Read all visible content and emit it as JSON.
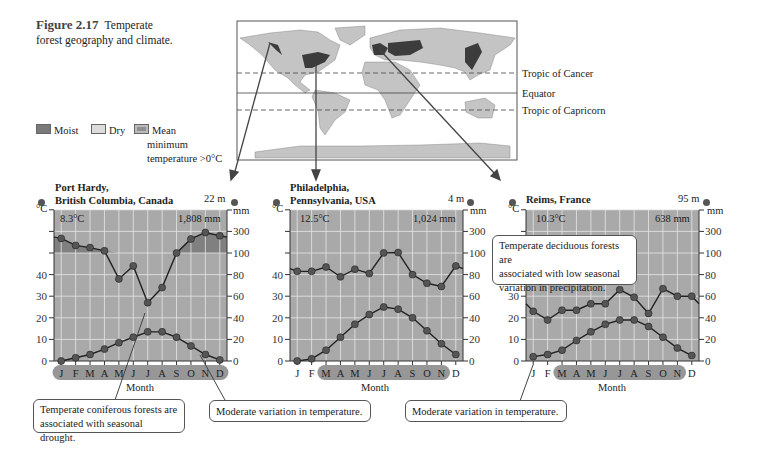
{
  "figure": {
    "number": "Figure 2.17",
    "caption_line1": "Temperate",
    "caption_line2": "forest geography and climate."
  },
  "legend": {
    "moist": "Moist",
    "dry": "Dry",
    "mean_line1": "Mean",
    "mean_line2": "minimum",
    "mean_line3": "temperature >0°C",
    "colors": {
      "moist": "#7a7a7a",
      "dry": "#d8d8d8",
      "mean_min": "#909090"
    }
  },
  "map": {
    "tropic_cancer": "Tropic of Cancer",
    "equator": "Equator",
    "tropic_capricorn": "Tropic of Capricorn"
  },
  "colors": {
    "plot_bg": "#a9a9a9",
    "moist_band": "#808080",
    "grid": "#e6e6e6",
    "line": "#222222",
    "dot": "#555555",
    "land": "#c4c4c4",
    "forest": "#3c3c3c",
    "month_band": "#7d7d7d"
  },
  "callouts": {
    "coniferous_line1": "Temperate coniferous forests are",
    "coniferous_line2": "associated with seasonal drought.",
    "moderate1": "Moderate variation in temperature.",
    "moderate2": "Moderate variation in temperature.",
    "deciduous_line1": "Temperate deciduous forests are",
    "deciduous_line2": "associated with low seasonal",
    "deciduous_line3": "variation in precipitation."
  },
  "axes": {
    "left_unit": "°C",
    "right_unit": "mm",
    "left_ticks": [
      "40",
      "30",
      "20",
      "10",
      "0"
    ],
    "right_ticks": [
      "300",
      "100",
      "80",
      "60",
      "40",
      "20",
      "0"
    ],
    "xlabel": "Month",
    "months": [
      "J",
      "F",
      "M",
      "A",
      "M",
      "J",
      "J",
      "A",
      "S",
      "O",
      "N",
      "D"
    ]
  },
  "chart_data": [
    {
      "type": "line",
      "title": "Port Hardy, British Columbia, Canada",
      "station_line1": "Port Hardy,",
      "station_line2": "British Columbia, Canada",
      "altitude": "22 m",
      "mean_temp": "8.3°C",
      "annual_precip": "1,808 mm",
      "xlabel": "Month",
      "ylabel_left": "°C",
      "ylabel_right": "mm",
      "categories": [
        "J",
        "F",
        "M",
        "A",
        "M",
        "J",
        "J",
        "A",
        "S",
        "O",
        "N",
        "D"
      ],
      "series": [
        {
          "name": "Precipitation (mm)",
          "values": [
            235,
            170,
            150,
            120,
            76,
            88,
            54,
            68,
            100,
            230,
            290,
            260
          ]
        },
        {
          "name": "Temperature (°C)",
          "values": [
            0,
            1.5,
            3,
            5.5,
            8.5,
            11,
            13.5,
            13.5,
            11,
            7,
            3,
            0.5
          ]
        }
      ],
      "months_above_zero_min": [
        0,
        11
      ],
      "ylim_left": [
        0,
        50
      ],
      "ylim_right": [
        0,
        400
      ]
    },
    {
      "type": "line",
      "title": "Philadelphia, Pennsylvania, USA",
      "station_line1": "Philadelphia,",
      "station_line2": "Pennsylvania, USA",
      "altitude": "4 m",
      "mean_temp": "12.5°C",
      "annual_precip": "1,024 mm",
      "xlabel": "Month",
      "ylabel_left": "°C",
      "ylabel_right": "mm",
      "categories": [
        "J",
        "F",
        "M",
        "A",
        "M",
        "J",
        "J",
        "A",
        "S",
        "O",
        "N",
        "D"
      ],
      "series": [
        {
          "name": "Precipitation (mm)",
          "values": [
            83,
            83,
            87,
            78,
            85,
            81,
            101,
            104,
            80,
            72,
            69,
            88
          ]
        },
        {
          "name": "Temperature (°C)",
          "values": [
            0,
            1,
            5,
            11,
            17,
            21.5,
            25,
            24,
            20,
            14,
            8,
            3
          ]
        }
      ],
      "months_above_zero_min": [
        2,
        10
      ],
      "ylim_left": [
        0,
        50
      ],
      "ylim_right": [
        0,
        400
      ]
    },
    {
      "type": "line",
      "title": "Reims, France",
      "station_line1": "Reims, France",
      "station_line2": "",
      "altitude": "95 m",
      "mean_temp": "10.3°C",
      "annual_precip": "638 mm",
      "xlabel": "Month",
      "ylabel_left": "°C",
      "ylabel_right": "mm",
      "categories": [
        "J",
        "F",
        "M",
        "A",
        "M",
        "J",
        "J",
        "A",
        "S",
        "O",
        "N",
        "D"
      ],
      "series": [
        {
          "name": "Precipitation (mm)",
          "values": [
            46,
            38,
            47,
            47,
            53,
            53,
            66,
            59,
            44,
            67,
            60,
            60
          ]
        },
        {
          "name": "Temperature (°C)",
          "values": [
            2,
            3,
            5,
            9.5,
            13.5,
            17,
            19,
            19,
            16,
            11,
            6,
            2.5
          ]
        }
      ],
      "months_above_zero_min": [
        2,
        10
      ],
      "ylim_left": [
        0,
        50
      ],
      "ylim_right": [
        0,
        400
      ]
    }
  ]
}
